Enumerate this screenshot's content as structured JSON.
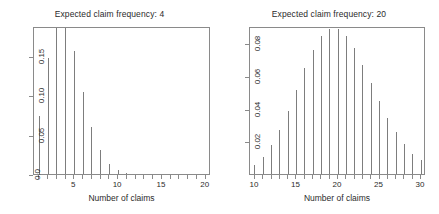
{
  "figure": {
    "background_color": "#ffffff",
    "stem_color": "#7d7d7d",
    "axis_color": "#8a8a8a",
    "text_color": "#2b2b2b",
    "width": 439,
    "height": 214
  },
  "chart_data": [
    {
      "type": "bar",
      "panel": "left",
      "title": "Expected claim frequency: 4",
      "xlabel": "Number of claims",
      "ylabel": "",
      "xlim": [
        0.4,
        20.6
      ],
      "ylim": [
        0.0,
        0.1875
      ],
      "grid": false,
      "legend": null,
      "xticks": [
        5,
        10,
        15,
        20
      ],
      "xticklabels": [
        "5",
        "10",
        "15",
        "20"
      ],
      "xminorticks": [
        1,
        2,
        3,
        4,
        6,
        7,
        8,
        9,
        11,
        12,
        13,
        14,
        16,
        17,
        18,
        19
      ],
      "yticks": [
        0.0,
        0.05,
        0.1,
        0.15
      ],
      "yticklabels": [
        "0.0",
        "0.05",
        "0.10",
        "0.15"
      ],
      "categories": [
        1,
        2,
        3,
        4,
        5,
        6,
        7,
        8,
        9,
        10,
        11,
        12,
        13,
        14,
        15,
        16,
        17,
        18,
        19,
        20
      ],
      "values": [
        0.0733,
        0.1465,
        0.1954,
        0.1954,
        0.1563,
        0.1042,
        0.0595,
        0.0298,
        0.0132,
        0.0053,
        0.0019,
        0.0006,
        0.0002,
        0.0001,
        0.0,
        0.0,
        0.0,
        0.0,
        0.0,
        0.0
      ]
    },
    {
      "type": "bar",
      "panel": "right",
      "title": "Expected claim frequency: 20",
      "xlabel": "Number of claims",
      "ylabel": "",
      "xlim": [
        9.4,
        30.6
      ],
      "ylim": [
        0.0,
        0.0905
      ],
      "grid": false,
      "legend": null,
      "xticks": [
        10,
        15,
        20,
        25,
        30
      ],
      "xticklabels": [
        "10",
        "15",
        "20",
        "25",
        "30"
      ],
      "xminorticks": [
        11,
        12,
        13,
        14,
        16,
        17,
        18,
        19,
        21,
        22,
        23,
        24,
        26,
        27,
        28,
        29
      ],
      "yticks": [
        0.02,
        0.04,
        0.06,
        0.08
      ],
      "yticklabels": [
        "0.02",
        "0.04",
        "0.06",
        "0.08"
      ],
      "categories": [
        10,
        11,
        12,
        13,
        14,
        15,
        16,
        17,
        18,
        19,
        20,
        21,
        22,
        23,
        24,
        25,
        26,
        27,
        28,
        29,
        30
      ],
      "values": [
        0.0058,
        0.0106,
        0.0176,
        0.0271,
        0.0387,
        0.0516,
        0.0646,
        0.076,
        0.0844,
        0.0888,
        0.0888,
        0.0846,
        0.0769,
        0.0669,
        0.0557,
        0.0446,
        0.0343,
        0.0254,
        0.0181,
        0.0125,
        0.0083
      ]
    }
  ]
}
